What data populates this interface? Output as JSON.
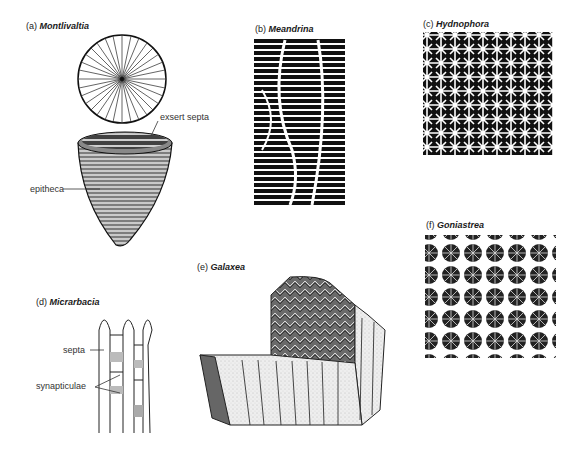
{
  "figure": {
    "panels": [
      {
        "id": "a",
        "letter": "(a)",
        "genus": "Montlivaltia",
        "annotations": [
          {
            "text": "exsert septa"
          },
          {
            "text": "epitheca"
          }
        ]
      },
      {
        "id": "b",
        "letter": "(b)",
        "genus": "Meandrina",
        "annotations": []
      },
      {
        "id": "c",
        "letter": "(c)",
        "genus": "Hydnophora",
        "annotations": []
      },
      {
        "id": "d",
        "letter": "(d)",
        "genus": "Micrarbacia",
        "annotations": [
          {
            "text": "septa"
          },
          {
            "text": "synapticulae"
          }
        ]
      },
      {
        "id": "e",
        "letter": "(e)",
        "genus": "Galaxea",
        "annotations": []
      },
      {
        "id": "f",
        "letter": "(f)",
        "genus": "Goniastrea",
        "annotations": []
      }
    ]
  },
  "colors": {
    "ink": "#1a1a1a",
    "paper": "#ffffff",
    "stipple": "#e6e6e6",
    "dark_face": "#555555"
  }
}
